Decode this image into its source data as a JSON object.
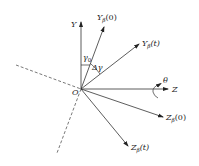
{
  "diagram": {
    "type": "coordinate-frame-rotation",
    "origin": {
      "label": "O",
      "x": 81,
      "y": 89
    },
    "axes": [
      {
        "id": "Y",
        "label": "Y",
        "sub": "",
        "arg": "",
        "tip": [
          81,
          22
        ],
        "label_pos": [
          71,
          27
        ]
      },
      {
        "id": "Ybeta0",
        "label": "Y",
        "sub": "β",
        "arg": "(0)",
        "tip": [
          104,
          27
        ],
        "label_pos": [
          97,
          20
        ]
      },
      {
        "id": "Ybetat",
        "label": "Y",
        "sub": "β",
        "arg": "(t)",
        "tip": [
          139,
          44
        ],
        "label_pos": [
          142,
          46
        ]
      },
      {
        "id": "Z",
        "label": "Z",
        "sub": "",
        "arg": "",
        "tip": [
          168,
          89
        ],
        "label_pos": [
          172,
          92
        ]
      },
      {
        "id": "Zbeta0",
        "label": "Z",
        "sub": "β",
        "arg": "(0)",
        "tip": [
          163,
          117
        ],
        "label_pos": [
          166,
          120
        ]
      },
      {
        "id": "Zbetat",
        "label": "Z",
        "sub": "β",
        "arg": "(t)",
        "tip": [
          128,
          146
        ],
        "label_pos": [
          131,
          150
        ]
      }
    ],
    "dashed_lines": [
      {
        "from": [
          16,
          65
        ],
        "to": [
          81,
          89
        ]
      },
      {
        "from": [
          81,
          89
        ],
        "to": [
          57,
          153
        ]
      }
    ],
    "angles": [
      {
        "id": "gamma0",
        "label": "γ",
        "sub": "0",
        "label_pos": [
          83,
          59
        ]
      },
      {
        "id": "delta_gamma",
        "label": "Δγ",
        "label_pos": [
          92,
          69
        ]
      }
    ],
    "rotation": {
      "label": "θ",
      "label_pos": [
        163,
        83
      ]
    }
  }
}
